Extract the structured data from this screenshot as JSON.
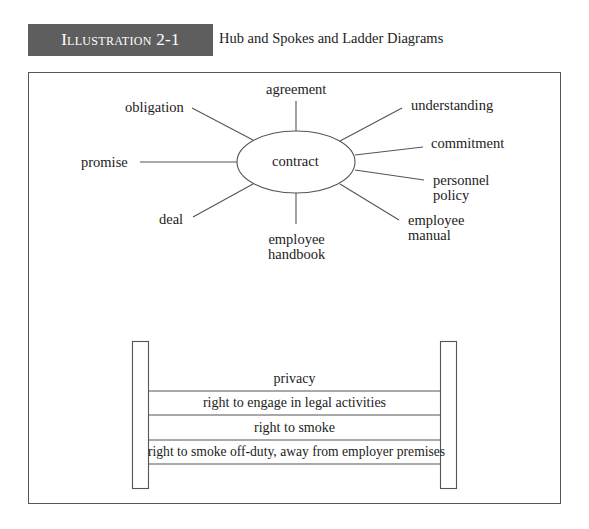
{
  "header": {
    "badge": "Illustration 2-1",
    "title": "Hub and Spokes and Ladder Diagrams"
  },
  "hub": {
    "center_label": "contract",
    "spokes": [
      {
        "label": "agreement"
      },
      {
        "label": "understanding"
      },
      {
        "label": "commitment"
      },
      {
        "label_line1": "personnel",
        "label_line2": "policy"
      },
      {
        "label_line1": "employee",
        "label_line2": "manual"
      },
      {
        "label_line1": "employee",
        "label_line2": "handbook"
      },
      {
        "label": "deal"
      },
      {
        "label": "promise"
      },
      {
        "label": "obligation"
      }
    ]
  },
  "ladder": {
    "rungs": [
      {
        "label": "privacy"
      },
      {
        "label": "right to engage in legal activities"
      },
      {
        "label": "right to smoke"
      },
      {
        "label": "right to smoke off-duty, away from employer premises"
      }
    ]
  },
  "colors": {
    "badge_bg": "#5e5e5e",
    "line": "#555555"
  }
}
